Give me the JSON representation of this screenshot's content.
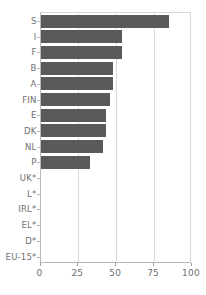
{
  "chart_data": {
    "type": "bar",
    "orientation": "horizontal",
    "title": "",
    "subtitle": "",
    "xlabel": "",
    "ylabel": "",
    "xlim": [
      0,
      100
    ],
    "xticks": [
      0,
      25,
      50,
      75,
      100
    ],
    "xtick_labels": [
      "0",
      "25",
      "50",
      "75",
      "100"
    ],
    "grid": true,
    "grid_axis": "x",
    "legend": false,
    "legend_position": "none",
    "bar_color": "#5a5a5a",
    "axis_color": "#b9b9b9",
    "gridline_color": "#d9d9d9",
    "tick_label_color": "#6f6f6f",
    "categories": [
      "S",
      "I",
      "F",
      "B",
      "A",
      "FIN",
      "E",
      "DK",
      "NL",
      "P",
      "UK*",
      "L*",
      "IRL*",
      "EL*",
      "D*",
      "EU-15*"
    ],
    "values": [
      85,
      54,
      54,
      48,
      48,
      46,
      43,
      43,
      41,
      33,
      0,
      0,
      0,
      0,
      0,
      0
    ],
    "series": [
      {
        "name": "",
        "values": [
          85,
          54,
          54,
          48,
          48,
          46,
          43,
          43,
          41,
          33,
          0,
          0,
          0,
          0,
          0,
          0
        ]
      }
    ]
  },
  "rows": [
    {
      "label": "S",
      "value": 85
    },
    {
      "label": "I",
      "value": 54
    },
    {
      "label": "F",
      "value": 54
    },
    {
      "label": "B",
      "value": 48
    },
    {
      "label": "A",
      "value": 48
    },
    {
      "label": "FIN",
      "value": 46
    },
    {
      "label": "E",
      "value": 43
    },
    {
      "label": "DK",
      "value": 43
    },
    {
      "label": "NL",
      "value": 41
    },
    {
      "label": "P",
      "value": 33
    },
    {
      "label": "UK*",
      "value": 0
    },
    {
      "label": "L*",
      "value": 0
    },
    {
      "label": "IRL*",
      "value": 0
    },
    {
      "label": "EL*",
      "value": 0
    },
    {
      "label": "D*",
      "value": 0
    },
    {
      "label": "EU-15*",
      "value": 0
    }
  ],
  "xaxis": {
    "ticks": [
      {
        "value": 0,
        "label": "0"
      },
      {
        "value": 25,
        "label": "25"
      },
      {
        "value": 50,
        "label": "50"
      },
      {
        "value": 75,
        "label": "75"
      },
      {
        "value": 100,
        "label": "100"
      }
    ]
  }
}
